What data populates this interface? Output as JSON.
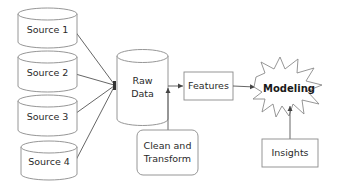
{
  "diagram": {
    "type": "data-pipeline-flowchart",
    "nodes": {
      "source1": {
        "label": "Source 1",
        "shape": "cylinder"
      },
      "source2": {
        "label": "Source 2",
        "shape": "cylinder"
      },
      "source3": {
        "label": "Source 3",
        "shape": "cylinder"
      },
      "source4": {
        "label": "Source 4",
        "shape": "cylinder"
      },
      "raw_data": {
        "label_line1": "Raw",
        "label_line2": "Data",
        "shape": "cylinder"
      },
      "clean_transform": {
        "label_line1": "Clean and",
        "label_line2": "Transform",
        "shape": "rounded-rectangle"
      },
      "features": {
        "label": "Features",
        "shape": "rectangle"
      },
      "modeling": {
        "label": "Modeling",
        "shape": "starburst"
      },
      "insights": {
        "label": "Insights",
        "shape": "rectangle"
      }
    },
    "edges": [
      {
        "from": "Source 1",
        "to": "Raw Data"
      },
      {
        "from": "Source 2",
        "to": "Raw Data"
      },
      {
        "from": "Source 3",
        "to": "Raw Data"
      },
      {
        "from": "Source 4",
        "to": "Raw Data"
      },
      {
        "from": "Raw Data",
        "to": "Features"
      },
      {
        "from": "Clean and Transform",
        "to": "Raw Data → Features edge"
      },
      {
        "from": "Features",
        "to": "Modeling"
      },
      {
        "from": "Insights",
        "to": "Modeling"
      }
    ],
    "colors": {
      "stroke": "#8a8a8a",
      "edge": "#555555",
      "fill": "#ffffff",
      "text": "#2a2a2a"
    }
  }
}
